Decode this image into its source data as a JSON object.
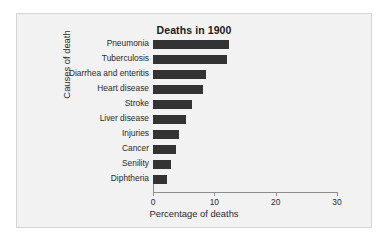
{
  "chart_data": {
    "type": "bar",
    "orientation": "horizontal",
    "title": "Deaths in 1900",
    "xlabel": "Percentage of deaths",
    "ylabel": "Causes of death",
    "categories": [
      "Pneumonia",
      "Tuberculosis",
      "Diarrhea and enteritis",
      "Heart disease",
      "Stroke",
      "Liver disease",
      "Injuries",
      "Cancer",
      "Senility",
      "Diphtheria"
    ],
    "values": [
      12.4,
      12.1,
      8.6,
      8.1,
      6.4,
      5.3,
      4.3,
      3.8,
      3.0,
      2.3
    ],
    "xlim": [
      0,
      30
    ],
    "xticks": [
      0,
      10,
      20,
      30
    ],
    "xtick_labels": [
      "0",
      "10",
      "20",
      "30"
    ],
    "grid": false,
    "legend": "none",
    "bar_color": "#333333",
    "panel_color": "#f2f2f2",
    "axis_color": "#8c8c8c"
  }
}
